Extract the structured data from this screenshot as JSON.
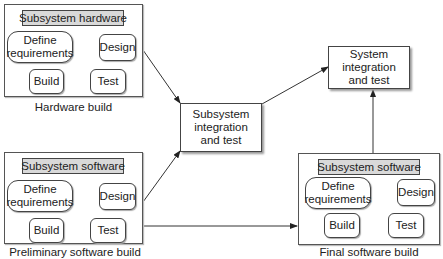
{
  "diagram": {
    "hardware_group": {
      "header": "Subsystem hardware",
      "caption": "Hardware build",
      "nodes": {
        "define": "Define requirements",
        "design": "Design",
        "build": "Build",
        "test": "Test"
      }
    },
    "prelim_software_group": {
      "header": "Subsystem software",
      "caption": "Preliminary software build",
      "nodes": {
        "define": "Define requirements",
        "design": "Design",
        "build": "Build",
        "test": "Test"
      }
    },
    "final_software_group": {
      "header": "Subsystem software",
      "caption": "Final software build",
      "nodes": {
        "define": "Define requirements",
        "design": "Design",
        "build": "Build",
        "test": "Test"
      }
    },
    "subsystem_integration": "Subsystem integration and test",
    "system_integration": "System integration and test",
    "edges": [
      {
        "from": "Define requirements",
        "to": "Design"
      },
      {
        "from": "Design",
        "to": "Build"
      },
      {
        "from": "Build",
        "to": "Test"
      },
      {
        "from": "Hardware build",
        "to": "Subsystem integration and test"
      },
      {
        "from": "Preliminary software build",
        "to": "Subsystem integration and test"
      },
      {
        "from": "Preliminary software build",
        "to": "Final software build"
      },
      {
        "from": "Subsystem integration and test",
        "to": "System integration and test"
      },
      {
        "from": "Final software build",
        "to": "System integration and test"
      }
    ]
  }
}
